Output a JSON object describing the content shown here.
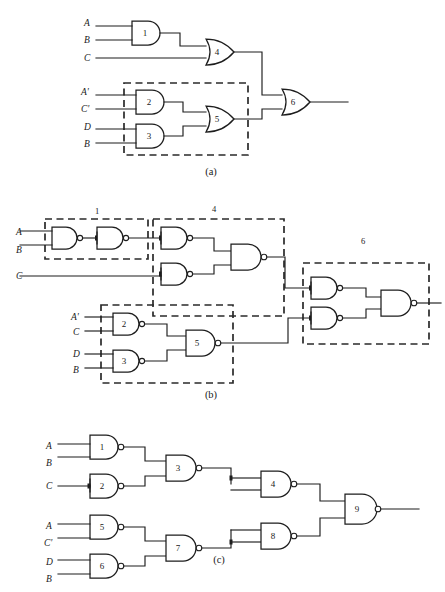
{
  "figure": {
    "background_color": "#ffffff",
    "line_color": "#1d1d1d",
    "panels": [
      {
        "id": "a",
        "caption": "(a)",
        "gate_technology": "AND-OR",
        "inputs": [
          "A",
          "B",
          "C",
          "A'",
          "C'",
          "D",
          "B"
        ],
        "gates": [
          {
            "number": "1",
            "type": "AND",
            "inputs": [
              "A",
              "B"
            ]
          },
          {
            "number": "4",
            "type": "OR",
            "inputs": [
              "gate1",
              "C"
            ]
          },
          {
            "number": "2",
            "type": "AND",
            "inputs": [
              "A'",
              "C'"
            ]
          },
          {
            "number": "3",
            "type": "AND",
            "inputs": [
              "D",
              "B"
            ]
          },
          {
            "number": "5",
            "type": "OR",
            "inputs": [
              "gate2",
              "gate3"
            ]
          },
          {
            "number": "6",
            "type": "OR",
            "inputs": [
              "gate4",
              "gate5"
            ]
          }
        ],
        "dashed_boxes": [
          {
            "label": "",
            "contains": [
              "2",
              "3",
              "5"
            ]
          }
        ]
      },
      {
        "id": "b",
        "caption": "(b)",
        "gate_technology": "NAND",
        "inputs": [
          "A",
          "B",
          "C",
          "A'",
          "C",
          "D",
          "B"
        ],
        "gates": [
          {
            "number": "1",
            "type": "NAND-pair",
            "inputs": [
              "A",
              "B"
            ]
          },
          {
            "number": "4",
            "type": "NAND-tree",
            "inputs": [
              "gate1",
              "C"
            ]
          },
          {
            "number": "2",
            "type": "NAND",
            "inputs": [
              "A'",
              "C"
            ]
          },
          {
            "number": "3",
            "type": "NAND",
            "inputs": [
              "D",
              "B"
            ]
          },
          {
            "number": "5",
            "type": "NAND",
            "inputs": [
              "gate2",
              "gate3"
            ]
          },
          {
            "number": "6",
            "type": "NAND-tree",
            "inputs": [
              "gate4",
              "gate5"
            ]
          }
        ],
        "dashed_boxes": [
          {
            "label": "1",
            "contains": [
              "1a",
              "1b"
            ]
          },
          {
            "label": "4",
            "contains": [
              "4a",
              "4b",
              "4c"
            ]
          },
          {
            "label": "6",
            "contains": [
              "6a",
              "6b",
              "6c"
            ]
          },
          {
            "label": "",
            "contains": [
              "2",
              "3",
              "5"
            ]
          }
        ]
      },
      {
        "id": "c",
        "caption": "(c)",
        "gate_technology": "NAND",
        "inputs": [
          "A",
          "B",
          "C",
          "A",
          "C'",
          "D",
          "B"
        ],
        "gates": [
          {
            "number": "1",
            "type": "NAND",
            "inputs": [
              "A",
              "B"
            ]
          },
          {
            "number": "2",
            "type": "NAND",
            "inputs": [
              "C",
              "C"
            ]
          },
          {
            "number": "3",
            "type": "NAND",
            "inputs": [
              "gate1",
              "gate2"
            ]
          },
          {
            "number": "4",
            "type": "NAND",
            "inputs": [
              "gate3",
              "gate3"
            ]
          },
          {
            "number": "5",
            "type": "NAND",
            "inputs": [
              "A",
              "C'"
            ]
          },
          {
            "number": "6",
            "type": "NAND",
            "inputs": [
              "D",
              "B"
            ]
          },
          {
            "number": "7",
            "type": "NAND",
            "inputs": [
              "gate5",
              "gate6"
            ]
          },
          {
            "number": "8",
            "type": "NAND",
            "inputs": [
              "gate7",
              "gate7"
            ]
          },
          {
            "number": "9",
            "type": "NAND",
            "inputs": [
              "gate4",
              "gate8"
            ]
          }
        ],
        "dashed_boxes": []
      }
    ],
    "panel_a": {
      "labels": {
        "in_A": "A",
        "in_B": "B",
        "in_C": "C",
        "in_Ap": "A'",
        "in_Cp": "C'",
        "in_D": "D",
        "in_B2": "B",
        "g1": "1",
        "g2": "2",
        "g3": "3",
        "g4": "4",
        "g5": "5",
        "g6": "6",
        "caption": "(a)"
      }
    },
    "panel_b": {
      "labels": {
        "in_A": "A",
        "in_B": "B",
        "in_C": "C",
        "in_Ap": "A'",
        "in_C2": "C",
        "in_D": "D",
        "in_B2": "B",
        "box1": "1",
        "box4": "4",
        "box6": "6",
        "g2": "2",
        "g3": "3",
        "g5": "5",
        "caption": "(b)"
      }
    },
    "panel_c": {
      "labels": {
        "in_A": "A",
        "in_B": "B",
        "in_C": "C",
        "in_A2": "A",
        "in_Cp": "C'",
        "in_D": "D",
        "in_B2": "B",
        "g1": "1",
        "g2": "2",
        "g3": "3",
        "g4": "4",
        "g5": "5",
        "g6": "6",
        "g7": "7",
        "g8": "8",
        "g9": "9",
        "caption": "(c)"
      }
    }
  }
}
